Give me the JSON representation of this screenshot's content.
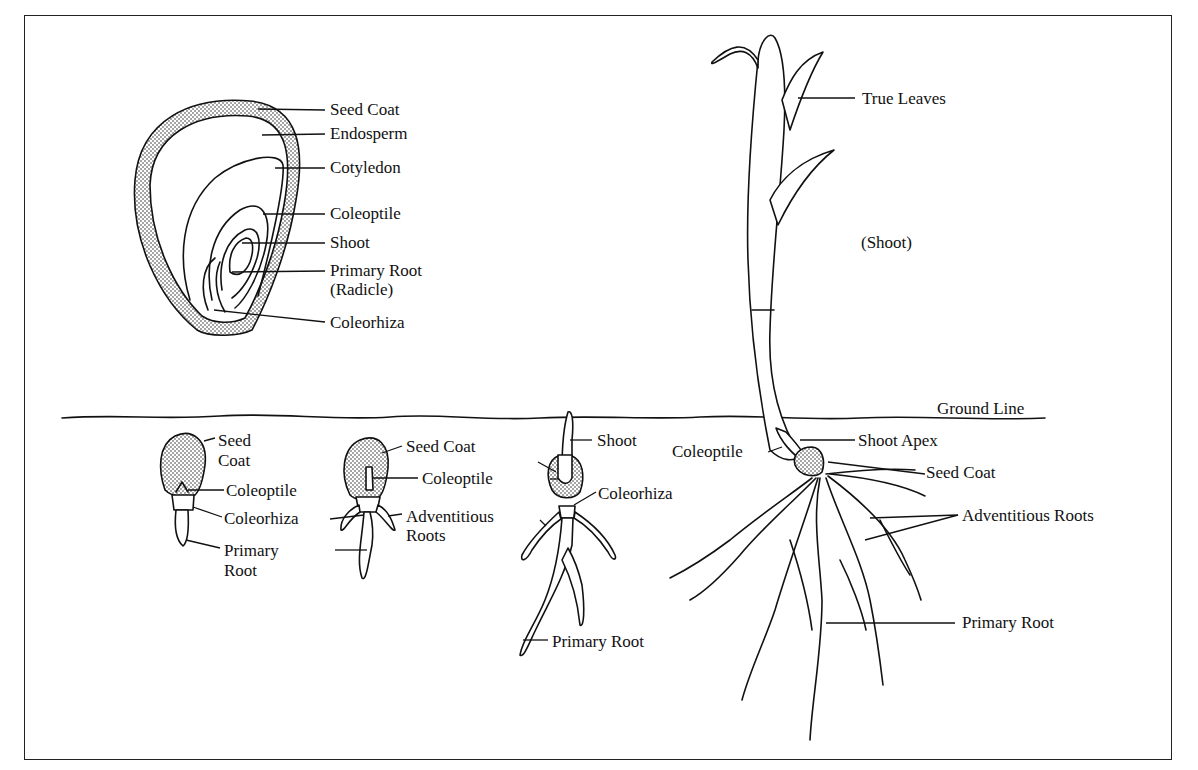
{
  "diagram": {
    "ground_line": "Ground Line",
    "seed_cross_section": {
      "labels": [
        "Seed Coat",
        "Endosperm",
        "Cotyledon",
        "Coleoptile",
        "Shoot",
        "Primary Root",
        "(Radicle)",
        "Coleorhiza"
      ]
    },
    "stage1": {
      "labels": [
        "Seed",
        "Coat",
        "Coleoptile",
        "Coleorhiza",
        "Primary",
        "Root"
      ]
    },
    "stage2": {
      "labels": [
        "Seed Coat",
        "Coleoptile",
        "Adventitious",
        "Roots"
      ]
    },
    "stage3": {
      "labels": [
        "Shoot",
        "Coleorhiza",
        "Primary Root"
      ]
    },
    "seedling": {
      "labels": [
        "True Leaves",
        "(Shoot)",
        "Shoot Apex",
        "Coleoptile",
        "Seed Coat",
        "Adventitious Roots",
        "Primary Root"
      ]
    },
    "colors": {
      "ink": "#111111",
      "background": "#ffffff"
    }
  }
}
